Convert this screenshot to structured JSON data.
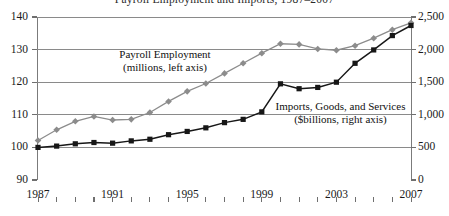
{
  "figure": {
    "title_clipped": "Payroll Employment and Imports, 1987–2007",
    "background": "#ffffff"
  },
  "annotations": {
    "payroll": {
      "line1": "Payroll Employment",
      "line2": "(millions, left axis)"
    },
    "imports": {
      "line1": "Imports, Goods, and Services",
      "line2": "($billions, right axis)"
    }
  },
  "axes": {
    "left": {
      "ticks": [
        "140",
        "130",
        "120",
        "110",
        "100",
        "90"
      ],
      "min": 90,
      "max": 140
    },
    "right": {
      "ticks": [
        "2,500",
        "2,000",
        "1,500",
        "1,000",
        "500",
        "0"
      ],
      "min": 0,
      "max": 2500
    },
    "x": {
      "labels": [
        "1987",
        "1991",
        "1995",
        "1999",
        "2003",
        "2007"
      ],
      "label_years": [
        1987,
        1991,
        1995,
        1999,
        2003,
        2007
      ],
      "tick_years": [
        1987,
        1988,
        1989,
        1990,
        1991,
        1992,
        1993,
        1994,
        1995,
        1996,
        1997,
        1998,
        1999,
        2000,
        2001,
        2002,
        2003,
        2004,
        2005,
        2006,
        2007
      ],
      "min": 1987,
      "max": 2007
    }
  },
  "colors": {
    "payroll": "#8c8c8c",
    "imports": "#171717",
    "grid": "#8a8a8a",
    "axis": "#7b7b7b",
    "text": "#1a1a1a"
  },
  "chart_data": {
    "type": "line",
    "title": "Payroll Employment and Imports, 1987–2007",
    "xlabel": "",
    "ylabel": "Payroll Employment (millions)",
    "y2label": "Imports, Goods, and Services ($billions)",
    "xlim": [
      1987,
      2007
    ],
    "ylim": [
      90,
      140
    ],
    "y2lim": [
      0,
      2500
    ],
    "grid": true,
    "legend": "annotations-inline",
    "x": [
      1987,
      1988,
      1989,
      1990,
      1991,
      1992,
      1993,
      1994,
      1995,
      1996,
      1997,
      1998,
      1999,
      2000,
      2001,
      2002,
      2003,
      2004,
      2005,
      2006,
      2007
    ],
    "series": [
      {
        "name": "Payroll Employment",
        "axis": "left",
        "unit": "millions",
        "marker": "diamond",
        "color": "#8c8c8c",
        "values": [
          102.1,
          105.4,
          108.0,
          109.5,
          108.4,
          108.6,
          110.7,
          114.1,
          117.2,
          119.6,
          122.7,
          125.8,
          128.9,
          131.8,
          131.6,
          130.2,
          129.8,
          131.2,
          133.5,
          136.1,
          138.2
        ]
      },
      {
        "name": "Imports, Goods, and Services",
        "axis": "right",
        "unit": "$billions",
        "marker": "square",
        "color": "#171717",
        "values": [
          500,
          520,
          555,
          575,
          565,
          600,
          625,
          695,
          745,
          800,
          880,
          930,
          1045,
          1475,
          1400,
          1420,
          1500,
          1790,
          1995,
          2215,
          2370
        ]
      }
    ]
  }
}
